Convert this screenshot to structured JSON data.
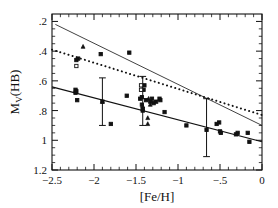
{
  "figure": {
    "name": "horizontal-branch-luminosity-metallicity-plot",
    "background": "#ffffff",
    "ink": "#111111"
  },
  "chart_data": {
    "type": "scatter",
    "title": "",
    "xlabel": "[Fe/H]",
    "ylabel": "M_V(HB)",
    "ylabel_parts": {
      "main": "M",
      "sub": "V",
      "tail": "(HB)"
    },
    "xlim": [
      -2.5,
      0.0
    ],
    "ylim": [
      1.2,
      0.15
    ],
    "y_inverted": true,
    "grid": false,
    "legend": null,
    "xticks": [
      -2.5,
      -2.0,
      -1.5,
      -1.0,
      -0.5,
      0.0
    ],
    "xticklabels": [
      "-2.5",
      "-2",
      "-1.5",
      "-1",
      "-.5",
      "0"
    ],
    "xminor_step": 0.1,
    "yticks": [
      0.2,
      0.4,
      0.6,
      0.8,
      1.0,
      1.2
    ],
    "yticklabels": [
      ".2",
      ".4",
      ".6",
      ".8",
      "1",
      "1.2"
    ],
    "yminor_step": 0.05,
    "tick_direction": "in",
    "series": [
      {
        "name": "filled-squares",
        "marker": "square",
        "fill": "solid",
        "color": "#111111",
        "points": [
          [
            -2.22,
            0.66
          ],
          [
            -2.22,
            0.68
          ],
          [
            -2.21,
            0.67
          ],
          [
            -2.2,
            0.73
          ],
          [
            -2.19,
            0.45
          ],
          [
            -2.21,
            0.46
          ],
          [
            -1.92,
            0.42
          ],
          [
            -1.9,
            0.74
          ],
          [
            -1.8,
            0.89
          ],
          [
            -1.61,
            0.7
          ],
          [
            -1.58,
            0.41
          ],
          [
            -1.45,
            0.72
          ],
          [
            -1.43,
            0.71
          ],
          [
            -1.43,
            0.76
          ],
          [
            -1.42,
            0.79
          ],
          [
            -1.42,
            0.8
          ],
          [
            -1.41,
            0.66
          ],
          [
            -1.4,
            0.63
          ],
          [
            -1.38,
            0.73
          ],
          [
            -1.33,
            0.74
          ],
          [
            -1.31,
            0.72
          ],
          [
            -1.29,
            0.75
          ],
          [
            -1.26,
            0.74
          ],
          [
            -1.22,
            0.72
          ],
          [
            -1.21,
            0.73
          ],
          [
            -1.16,
            0.81
          ],
          [
            -0.9,
            0.9
          ],
          [
            -0.66,
            0.93
          ],
          [
            -0.54,
            0.89
          ],
          [
            -0.51,
            0.88
          ],
          [
            -0.5,
            0.94
          ],
          [
            -0.49,
            0.95
          ],
          [
            -0.31,
            0.96
          ],
          [
            -0.29,
            0.95
          ],
          [
            -0.17,
            0.95
          ],
          [
            -0.15,
            1.01
          ]
        ]
      },
      {
        "name": "open-squares",
        "marker": "square",
        "fill": "open",
        "color": "#111111",
        "points": [
          [
            -2.21,
            0.5
          ],
          [
            -1.44,
            0.63
          ],
          [
            -1.44,
            0.66
          ]
        ]
      },
      {
        "name": "filled-triangles",
        "marker": "triangle",
        "fill": "solid",
        "color": "#111111",
        "points": [
          [
            -2.13,
            0.37
          ],
          [
            -1.9,
            0.74
          ],
          [
            -1.42,
            0.77
          ],
          [
            -1.35,
            0.72
          ],
          [
            -1.33,
            0.76
          ],
          [
            -1.36,
            0.85
          ],
          [
            -1.36,
            0.89
          ]
        ]
      }
    ],
    "errorbars": [
      {
        "name": "errorbar-left",
        "x": -1.9,
        "y": 0.74,
        "ylow": 0.9,
        "yhigh": 0.58
      },
      {
        "name": "errorbar-middle",
        "x": -1.42,
        "y": 0.74,
        "ylow": 0.9,
        "yhigh": 0.57
      },
      {
        "name": "errorbar-right",
        "x": -0.66,
        "y": 0.93,
        "ylow": 1.11,
        "yhigh": 0.72
      }
    ],
    "lines": [
      {
        "name": "thin-solid-upper-line",
        "style": "solid",
        "width": 0.8,
        "color": "#111111",
        "x": [
          -2.46,
          0.0
        ],
        "y": [
          0.22,
          0.9
        ]
      },
      {
        "name": "dotted-line",
        "style": "dotted",
        "width": 2.0,
        "color": "#111111",
        "x": [
          -2.5,
          0.0
        ],
        "y": [
          0.39,
          0.83
        ]
      },
      {
        "name": "solid-fit-line",
        "style": "solid",
        "width": 1.2,
        "color": "#111111",
        "x": [
          -2.5,
          0.0
        ],
        "y": [
          0.64,
          1.01
        ]
      }
    ]
  }
}
